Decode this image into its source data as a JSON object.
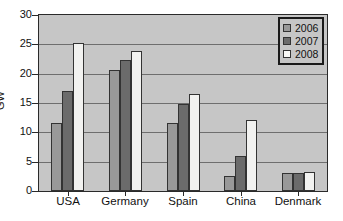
{
  "chart_data": {
    "type": "bar",
    "title": "",
    "xlabel": "",
    "ylabel": "GW",
    "ylim": [
      0,
      30
    ],
    "yticks": [
      0,
      5,
      10,
      15,
      20,
      25,
      30
    ],
    "grid": true,
    "legend_position": "top-right",
    "categories": [
      "USA",
      "Germany",
      "Spain",
      "China",
      "Denmark"
    ],
    "series": [
      {
        "name": "2006",
        "color": "#999999",
        "values": [
          11.6,
          20.6,
          11.6,
          2.6,
          3.1
        ]
      },
      {
        "name": "2007",
        "color": "#6b6b6b",
        "values": [
          17.0,
          22.3,
          14.9,
          6.0,
          3.1
        ]
      },
      {
        "name": "2008",
        "color": "#f2f2f0",
        "values": [
          25.3,
          23.9,
          16.5,
          12.1,
          3.2
        ]
      }
    ]
  },
  "axis": {
    "y_label": "GW",
    "y_tick_labels": [
      "0",
      "5",
      "10",
      "15",
      "20",
      "25",
      "30"
    ],
    "x_tick_labels": [
      "USA",
      "Germany",
      "Spain",
      "China",
      "Denmark"
    ]
  },
  "legend": {
    "entries": [
      {
        "label": "2006",
        "swatch": "legend-swatch-2006"
      },
      {
        "label": "2007",
        "swatch": "legend-swatch-2007"
      },
      {
        "label": "2008",
        "swatch": "legend-swatch-2008"
      }
    ]
  },
  "colors": {
    "plot_background": "#c6c6c6",
    "gridline": "#6e6e6e",
    "axis": "#2a2a2a",
    "series_2006": "#999999",
    "series_2007": "#6b6b6b",
    "series_2008": "#f2f2f0"
  }
}
